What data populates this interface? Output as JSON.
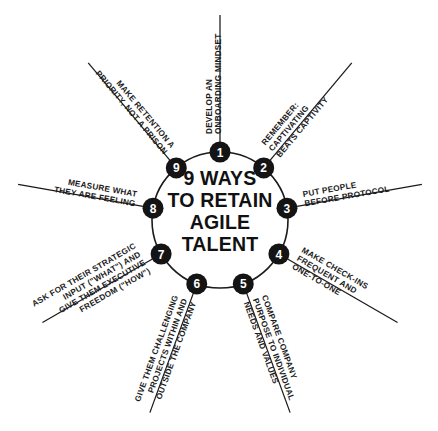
{
  "figure": {
    "title_lines": [
      "9 WAYS",
      "TO RETAIN",
      "AGILE",
      "TALENT"
    ],
    "colors": {
      "background": "#ffffff",
      "ink": "#141414",
      "node_fill": "#141414",
      "node_number": "#ffffff",
      "line": "#1a1a1a"
    }
  },
  "chart_data": {
    "type": "diagram",
    "layout": "radial-hub-and-spoke",
    "center_title": "9 WAYS TO RETAIN AGILE TALENT",
    "node_count": 9,
    "items": [
      {
        "number": "1",
        "lines": [
          "DEVELOP AN",
          "ONBOARDING MINDSET"
        ],
        "angle_deg": -90
      },
      {
        "number": "2",
        "lines": [
          "REMEMBER:",
          "CAPTIVATING",
          "BEATS CAPTIVITY"
        ],
        "angle_deg": -50
      },
      {
        "number": "3",
        "lines": [
          "PUT PEOPLE",
          "BEFORE PROTOCOL"
        ],
        "angle_deg": -10
      },
      {
        "number": "4",
        "lines": [
          "MAKE CHECK-INS",
          "FREQUENT AND",
          "ONE-TO-ONE"
        ],
        "angle_deg": 30
      },
      {
        "number": "5",
        "lines": [
          "COMPARE COMPANY",
          "PURPOSE TO INDIVIDUAL",
          "NEEDS AND VALUES"
        ],
        "angle_deg": 70
      },
      {
        "number": "6",
        "lines": [
          "GIVE THEM CHALLENGING",
          "PROJECTS WITHIN AND",
          "OUTSIDE THE COMPANY"
        ],
        "angle_deg": 110
      },
      {
        "number": "7",
        "lines": [
          "ASK FOR THEIR STRATEGIC",
          "INPUT (\"WHAT\") AND",
          "GIVE THEM EXECUTIVE",
          "FREEDOM (\"HOW\")"
        ],
        "angle_deg": 150
      },
      {
        "number": "8",
        "lines": [
          "MEASURE WHAT",
          "THEY ARE FEELING"
        ],
        "angle_deg": 190
      },
      {
        "number": "9",
        "lines": [
          "MAKE RETENTION A",
          "PRIORITY, NOT A PRISON"
        ],
        "angle_deg": 230
      }
    ]
  }
}
